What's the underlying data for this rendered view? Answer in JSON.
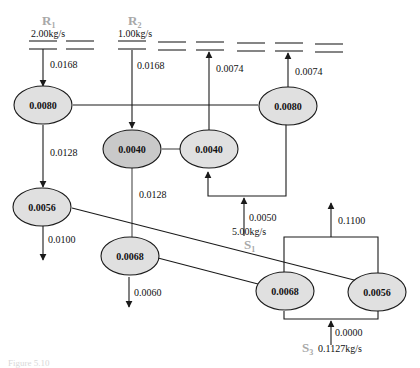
{
  "colors": {
    "node_fill": "#e0e0e0",
    "node_fill_dark": "#c9c9c9",
    "source_label": "#a8a8a8",
    "line": "#1a1a1a"
  },
  "sources": [
    {
      "id": "R1",
      "name": "R",
      "sub": "1",
      "rate": "2.00kg/s"
    },
    {
      "id": "R2",
      "name": "R",
      "sub": "2",
      "rate": "1.00kg/s"
    },
    {
      "id": "S1",
      "name": "S",
      "sub": "1",
      "rate": "5.00kg/s"
    },
    {
      "id": "S3",
      "name": "S",
      "sub": "3",
      "rate": "0.1127kg/s"
    }
  ],
  "nodes": [
    {
      "id": "n1",
      "label": "0.0080"
    },
    {
      "id": "n2",
      "label": "0.0040"
    },
    {
      "id": "n3",
      "label": "0.0040"
    },
    {
      "id": "n4",
      "label": "0.0080"
    },
    {
      "id": "n5",
      "label": "0.0056"
    },
    {
      "id": "n6",
      "label": "0.0068"
    },
    {
      "id": "n7",
      "label": "0.0068"
    },
    {
      "id": "n8",
      "label": "0.0056"
    }
  ],
  "flows": {
    "r1_in": "0.0168",
    "r2_in": "0.0168",
    "n3_out": "0.0074",
    "n4_out": "0.0074",
    "n1_n5": "0.0128",
    "n2_n6": "0.0128",
    "s1_in": "0.0050",
    "n5_out": "0.0100",
    "n6_out": "0.0060",
    "n7n8_out": "0.1100",
    "s3_in": "0.0000"
  },
  "caption": "Figure 5.10"
}
